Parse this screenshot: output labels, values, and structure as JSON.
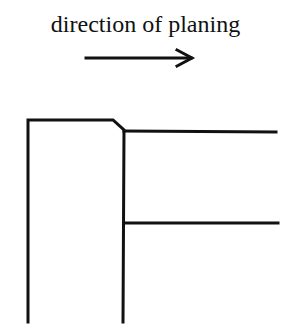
{
  "diagram": {
    "caption": "direction of planing",
    "arrow": {
      "direction": "right",
      "x1": 86,
      "x2": 193,
      "y": 58
    },
    "stroke_color": "#111111",
    "lines": {
      "left_vertical": {
        "x": 28,
        "y1": 120,
        "y2": 322
      },
      "top_edge": {
        "x1": 28,
        "x2": 113,
        "y": 120
      },
      "chamfer": {
        "x1": 113,
        "y1": 120,
        "x2": 124,
        "y2": 130
      },
      "right_vertical": {
        "x": 123,
        "y1": 130,
        "y2": 322
      },
      "upper_horizontal": {
        "x1": 124,
        "x2": 276,
        "y": 131
      },
      "lower_horizontal": {
        "x1": 124,
        "x2": 278,
        "y": 223
      }
    }
  }
}
